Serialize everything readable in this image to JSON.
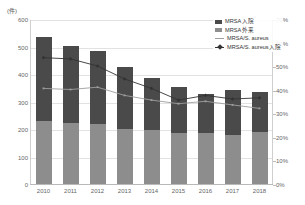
{
  "unit_label": "(件)",
  "legend": {
    "items": [
      {
        "label": "MRSA 入院",
        "marker": "box",
        "color": "#4a4a4a",
        "name": "legend-mrsa-inpatient"
      },
      {
        "label": "MRSA 外来",
        "marker": "box",
        "color": "#8d8d8d",
        "name": "legend-mrsa-outpatient"
      },
      {
        "label": "MRSA/S. aureus",
        "marker": "line",
        "color": "#9e9e9e",
        "name": "legend-mrsa-ratio"
      },
      {
        "label": "MRSA/S. aureus入院",
        "marker": "line-diamond",
        "color": "#333333",
        "name": "legend-mrsa-ratio-inpatient"
      }
    ]
  },
  "chart_data": {
    "type": "bar",
    "title": "",
    "subtitle": "",
    "xlabel": "",
    "ylabel": "(件)",
    "y2label": "",
    "categories": [
      "2010",
      "2011",
      "2012",
      "2013",
      "2014",
      "2015",
      "2016",
      "2017",
      "2018"
    ],
    "ylim": [
      0,
      600
    ],
    "yticks": [
      0,
      100,
      200,
      300,
      400,
      500,
      600
    ],
    "ytick_labels": [
      "0",
      "100",
      "200",
      "300",
      "400",
      "500",
      "600"
    ],
    "y2lim": [
      0,
      70
    ],
    "y2ticks": [
      0,
      10,
      20,
      30,
      40,
      50,
      60,
      70
    ],
    "y2tick_labels": [
      "0%",
      "10%",
      "20%",
      "30%",
      "40%",
      "50%",
      "60%",
      "70%"
    ],
    "grid": true,
    "legend_position": "top-right",
    "stacked": true,
    "series": [
      {
        "name": "MRSA 入院",
        "type": "bar",
        "axis": "left",
        "color": "#4a4a4a",
        "values": [
          305,
          280,
          265,
          225,
          190,
          170,
          140,
          165,
          145
        ]
      },
      {
        "name": "MRSA 外来",
        "type": "bar",
        "axis": "left",
        "color": "#8d8d8d",
        "values": [
          232,
          225,
          222,
          205,
          200,
          188,
          190,
          182,
          192
        ]
      },
      {
        "name": "MRSA/S. aureus",
        "type": "line",
        "axis": "right",
        "color": "#9e9e9e",
        "values": [
          41,
          40.5,
          41.5,
          38,
          36,
          34.5,
          35.5,
          34,
          32.5
        ]
      },
      {
        "name": "MRSA/S. aureus入院",
        "type": "line",
        "axis": "right",
        "color": "#333333",
        "values": [
          54,
          53.5,
          50.5,
          45,
          41,
          36,
          38,
          36.5,
          37
        ]
      }
    ]
  }
}
